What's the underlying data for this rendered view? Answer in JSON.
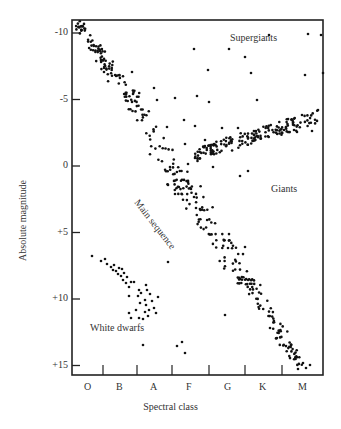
{
  "chart_data": {
    "type": "scatter",
    "title": "",
    "xlabel": "Spectral class",
    "ylabel": "Absolute magnitude",
    "categories": [
      "O",
      "B",
      "A",
      "F",
      "G",
      "K",
      "M"
    ],
    "y_ticks": [
      "-10",
      "-5",
      "0",
      "+5",
      "+10",
      "+15"
    ],
    "ylim": [
      -10.5,
      15.5
    ],
    "y_inverted": true,
    "grid": false,
    "legend": "none",
    "annotations": [
      "Supergiants",
      "Giants",
      "Main sequence",
      "White dwarfs"
    ],
    "series": [
      {
        "name": "Main sequence",
        "description": "diagonal band from O (-10.5) to M (+15)",
        "x_range": [
          "O",
          "M"
        ],
        "y_range": [
          -10.5,
          15
        ]
      },
      {
        "name": "Giants",
        "description": "horizontal band from G to M rising slightly",
        "x_range": [
          "G",
          "M"
        ],
        "y_range": [
          -3,
          0.5
        ]
      },
      {
        "name": "Supergiants",
        "description": "scattered points across top",
        "x_range": [
          "A",
          "M"
        ],
        "y_range": [
          -10,
          -4
        ]
      },
      {
        "name": "White dwarfs",
        "description": "clump in lower-left",
        "x_range": [
          "O",
          "A"
        ],
        "y_range": [
          7,
          12.5
        ]
      }
    ]
  },
  "axes": {
    "y_title": "Absolute magnitude",
    "x_title": "Spectral class",
    "y_ticks": [
      {
        "label": "-10",
        "value": -10
      },
      {
        "label": "-5",
        "value": -5
      },
      {
        "label": "0",
        "value": 0
      },
      {
        "label": "+5",
        "value": 5
      },
      {
        "label": "+10",
        "value": 10
      },
      {
        "label": "+15",
        "value": 15
      }
    ],
    "x_ticks": [
      "O",
      "B",
      "A",
      "F",
      "G",
      "K",
      "M"
    ]
  },
  "labels": {
    "supergiants": "Supergiants",
    "giants": "Giants",
    "main_sequence": "Main sequence",
    "white_dwarfs": "White dwarfs"
  }
}
